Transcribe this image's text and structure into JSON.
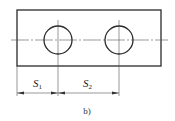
{
  "diagram": {
    "caption": "b)",
    "colors": {
      "outline": "#2a2a2a",
      "thin_line": "#555555",
      "background": "#ffffff"
    },
    "plate": {
      "x": 17,
      "y": 10,
      "width": 144,
      "height": 56
    },
    "holes": [
      {
        "name": "left-hole",
        "cx": 58,
        "cy": 40,
        "r": 14
      },
      {
        "name": "right-hole",
        "cx": 119,
        "cy": 40,
        "r": 14
      }
    ],
    "centerline": {
      "y": 40,
      "x1": 11,
      "x2": 168
    },
    "dimensions": [
      {
        "name": "dimension-s1",
        "symbol": "S",
        "subscript": "1",
        "from_x": 17,
        "to_x": 58,
        "y": 93
      },
      {
        "name": "dimension-s2",
        "symbol": "S",
        "subscript": "2",
        "from_x": 58,
        "to_x": 119,
        "y": 93
      }
    ]
  }
}
